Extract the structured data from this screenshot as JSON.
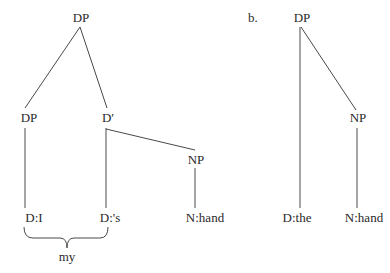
{
  "diagram_a": {
    "nodes": {
      "root": "DP",
      "spec": "DP",
      "dbar": "D′",
      "np": "NP",
      "d_i": "D:I",
      "d_s": "D:'s",
      "n_hand": "N:hand"
    },
    "brace_label": "my"
  },
  "diagram_b": {
    "label": "b.",
    "nodes": {
      "root": "DP",
      "np": "NP",
      "d_the": "D:the",
      "n_hand": "N:hand"
    }
  },
  "colors": {
    "line": "#4a4a4a",
    "text": "#2a2a2a",
    "background": "#ffffff"
  }
}
